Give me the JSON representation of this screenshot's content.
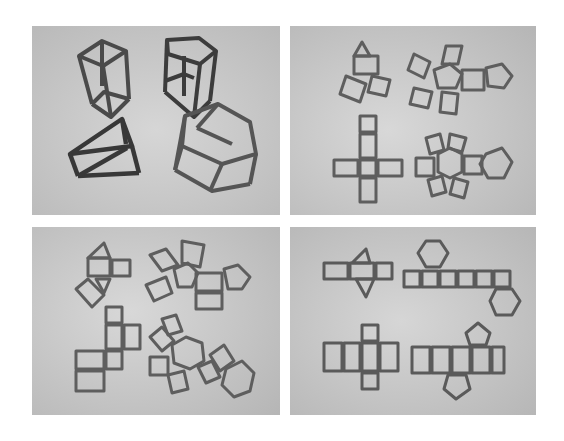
{
  "figure": {
    "layout": "2x2 photo grid",
    "panels": [
      {
        "id": "top-left",
        "subject": "3D prism frame models",
        "items": [
          "rectangular prism",
          "pentagonal prism",
          "triangular prism",
          "hexagonal prism"
        ]
      },
      {
        "id": "top-right",
        "subject": "prism nets (set 1)",
        "items": [
          "triangular prism net",
          "pentagonal prism net",
          "rectangular prism net",
          "hexagonal prism net"
        ]
      },
      {
        "id": "bottom-left",
        "subject": "prism nets (set 2)",
        "items": [
          "triangular prism net",
          "pentagonal prism net",
          "rectangular prism net",
          "hexagonal prism net"
        ]
      },
      {
        "id": "bottom-right",
        "subject": "prism nets (set 3)",
        "items": [
          "triangular prism net",
          "hexagonal prism net",
          "rectangular prism net",
          "pentagonal prism net"
        ]
      }
    ]
  },
  "colors": {
    "background": "#ffffff",
    "photo_bg_light": "#cfcfcf",
    "photo_bg_dark": "#b4b4b4",
    "stick": "#5e5e5e",
    "stick_dark": "#3a3a3a"
  }
}
